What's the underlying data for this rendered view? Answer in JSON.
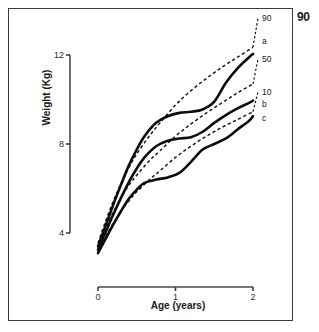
{
  "page": {
    "number": "90"
  },
  "chart_data": {
    "type": "line",
    "title": "",
    "xlabel": "Age (years)",
    "ylabel": "Weight (Kg)",
    "xlim": [
      0,
      2
    ],
    "ylim": [
      3.1,
      12.8
    ],
    "xticks": [
      "0",
      "1",
      "2"
    ],
    "xtick_values": [
      0,
      1,
      2
    ],
    "yticks": [
      "12",
      "8",
      "4"
    ],
    "ytick_values": [
      12,
      8,
      4
    ],
    "grid": false,
    "legend_position": "right-inline-end-labels",
    "series": [
      {
        "name": "90",
        "label": "90",
        "style": "dashed",
        "role": "percentile",
        "x": [
          0.0,
          0.1,
          0.2,
          0.3,
          0.4,
          0.5,
          0.65,
          0.8,
          1.0,
          1.2,
          1.4,
          1.6,
          1.8,
          2.0
        ],
        "y": [
          3.55,
          4.55,
          5.45,
          6.25,
          6.95,
          7.55,
          8.3,
          8.95,
          9.75,
          10.4,
          10.95,
          11.45,
          11.9,
          12.35
        ]
      },
      {
        "name": "50",
        "label": "50",
        "style": "dashed",
        "role": "percentile",
        "x": [
          0.0,
          0.1,
          0.2,
          0.3,
          0.4,
          0.5,
          0.65,
          0.8,
          1.0,
          1.2,
          1.4,
          1.6,
          1.8,
          2.0
        ],
        "y": [
          3.35,
          4.2,
          4.95,
          5.6,
          6.15,
          6.6,
          7.2,
          7.7,
          8.35,
          8.9,
          9.4,
          9.85,
          10.3,
          10.7
        ]
      },
      {
        "name": "10",
        "label": "10",
        "style": "dashed",
        "role": "percentile",
        "x": [
          0.0,
          0.1,
          0.2,
          0.3,
          0.4,
          0.5,
          0.65,
          0.8,
          1.0,
          1.2,
          1.4,
          1.6,
          1.8,
          2.0
        ],
        "y": [
          3.15,
          3.85,
          4.45,
          5.0,
          5.45,
          5.85,
          6.35,
          6.8,
          7.4,
          7.9,
          8.35,
          8.75,
          9.1,
          9.45
        ]
      },
      {
        "name": "a",
        "label": "a",
        "style": "solid",
        "role": "subject",
        "x": [
          0.0,
          0.1,
          0.2,
          0.3,
          0.4,
          0.5,
          0.6,
          0.75,
          0.9,
          1.05,
          1.2,
          1.35,
          1.5,
          1.65,
          1.8,
          1.95,
          2.0
        ],
        "y": [
          3.4,
          4.35,
          5.3,
          6.2,
          7.05,
          7.75,
          8.35,
          8.95,
          9.25,
          9.4,
          9.45,
          9.55,
          9.9,
          10.75,
          11.4,
          11.9,
          12.05
        ]
      },
      {
        "name": "b",
        "label": "b",
        "style": "solid",
        "role": "subject",
        "x": [
          0.0,
          0.1,
          0.2,
          0.3,
          0.4,
          0.5,
          0.6,
          0.75,
          0.9,
          1.05,
          1.2,
          1.35,
          1.5,
          1.65,
          1.8,
          1.95,
          2.0
        ],
        "y": [
          3.25,
          4.05,
          4.85,
          5.6,
          6.3,
          6.9,
          7.4,
          7.9,
          8.15,
          8.25,
          8.3,
          8.55,
          8.95,
          9.3,
          9.6,
          9.85,
          9.95
        ]
      },
      {
        "name": "c",
        "label": "c",
        "style": "solid",
        "role": "subject",
        "x": [
          0.0,
          0.1,
          0.2,
          0.3,
          0.4,
          0.5,
          0.6,
          0.75,
          0.9,
          1.05,
          1.2,
          1.35,
          1.5,
          1.65,
          1.8,
          1.95,
          2.0
        ],
        "y": [
          3.1,
          3.75,
          4.4,
          5.0,
          5.55,
          5.95,
          6.25,
          6.4,
          6.5,
          6.7,
          7.2,
          7.75,
          8.0,
          8.25,
          8.65,
          9.05,
          9.25
        ]
      }
    ],
    "annotations": [
      {
        "text": "90",
        "series": "90"
      },
      {
        "text": "a",
        "series": "a"
      },
      {
        "text": "50",
        "series": "50"
      },
      {
        "text": "10",
        "series": "10"
      },
      {
        "text": "b",
        "series": "b"
      },
      {
        "text": "c",
        "series": "c"
      }
    ]
  }
}
